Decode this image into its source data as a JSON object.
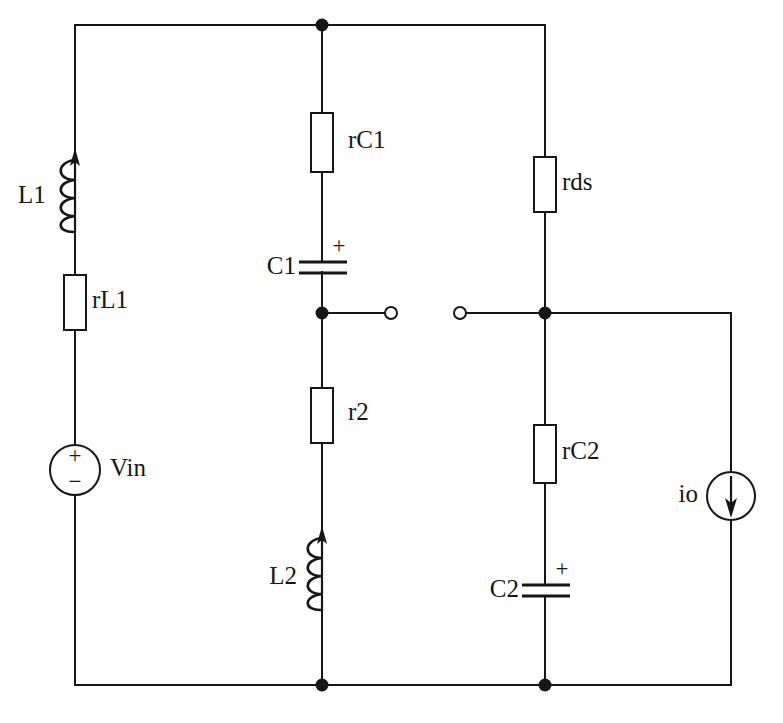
{
  "diagram": {
    "type": "electrical-schematic",
    "canvas": {
      "width": 783,
      "height": 723
    },
    "colors": {
      "background": "#ffffff",
      "wire": "#161616",
      "component_fill": "#ffffff",
      "node": "#161616"
    }
  },
  "components": {
    "L1": {
      "label": "L1",
      "kind": "inductor",
      "label_x": 18,
      "label_y": 197
    },
    "rL1": {
      "label": "rL1",
      "kind": "resistor",
      "label_x": 92,
      "label_y": 302
    },
    "Vin": {
      "label": "Vin",
      "kind": "voltage-source",
      "label_x": 110,
      "label_y": 470,
      "plus": "+",
      "minus": "−"
    },
    "rC1": {
      "label": "rC1",
      "kind": "resistor",
      "label_x": 348,
      "label_y": 142
    },
    "C1": {
      "label": "C1",
      "kind": "capacitor",
      "label_x": 274,
      "label_y": 268,
      "plus": "+"
    },
    "r2": {
      "label": "r2",
      "kind": "resistor",
      "label_x": 348,
      "label_y": 414
    },
    "L2": {
      "label": "L2",
      "kind": "inductor",
      "label_x": 272,
      "label_y": 578
    },
    "rds": {
      "label": "rds",
      "kind": "resistor",
      "label_x": 562,
      "label_y": 184
    },
    "rC2": {
      "label": "rC2",
      "kind": "resistor",
      "label_x": 562,
      "label_y": 453
    },
    "C2": {
      "label": "C2",
      "kind": "capacitor",
      "label_x": 497,
      "label_y": 591,
      "plus": "+"
    },
    "io": {
      "label": "io",
      "kind": "current-source",
      "label_x": 679,
      "label_y": 496,
      "direction": "down"
    }
  },
  "nodes": {
    "top_junction": {
      "x": 322,
      "y": 25
    },
    "mid_left_node": {
      "x": 322,
      "y": 313
    },
    "mid_right_node": {
      "x": 545,
      "y": 313
    },
    "bottom_left_node": {
      "x": 322,
      "y": 685
    },
    "bottom_right_node": {
      "x": 545,
      "y": 685
    }
  },
  "terminals": {
    "left_open": {
      "x": 391,
      "y": 313
    },
    "right_open": {
      "x": 460,
      "y": 313
    }
  }
}
